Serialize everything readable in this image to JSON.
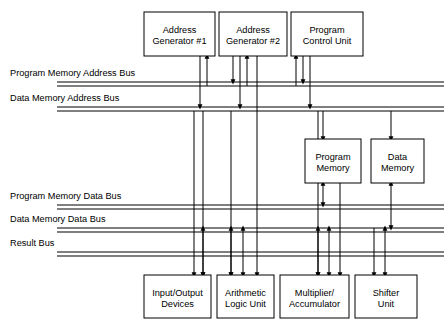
{
  "diagram": {
    "colors": {
      "line": "#000000",
      "background": "#ffffff",
      "box_fill": "#ffffff"
    },
    "units": [
      {
        "id": "address-generator-1",
        "line1": "Address",
        "line2": "Generator #1",
        "x": 144,
        "y": 12,
        "w": 71,
        "h": 44
      },
      {
        "id": "address-generator-2",
        "line1": "Address",
        "line2": "Generator #2",
        "x": 219,
        "y": 12,
        "w": 68,
        "h": 44
      },
      {
        "id": "program-control-unit",
        "line1": "Program",
        "line2": "Control Unit",
        "x": 291,
        "y": 12,
        "w": 72,
        "h": 44
      },
      {
        "id": "program-memory",
        "line1": "Program",
        "line2": "Memory",
        "x": 305,
        "y": 139,
        "w": 56,
        "h": 44
      },
      {
        "id": "data-memory",
        "line1": "Data",
        "line2": "Memory",
        "x": 371,
        "y": 139,
        "w": 53,
        "h": 44
      },
      {
        "id": "input-output-devices",
        "line1": "Input/Output",
        "line2": "Devices",
        "x": 144,
        "y": 275,
        "w": 67,
        "h": 43
      },
      {
        "id": "arithmetic-logic-unit",
        "line1": "Arithmetic",
        "line2": "Logic Unit",
        "x": 217,
        "y": 275,
        "w": 57,
        "h": 43
      },
      {
        "id": "multiplier-accumulator",
        "line1": "Multiplier/",
        "line2": "Accumulator",
        "x": 280,
        "y": 275,
        "w": 69,
        "h": 43
      },
      {
        "id": "shifter-unit",
        "line1": "Shifter",
        "line2": "Unit",
        "x": 355,
        "y": 275,
        "w": 62,
        "h": 43
      }
    ],
    "buses": [
      {
        "id": "program-memory-address-bus",
        "label": "Program Memory Address Bus",
        "label_x": 10,
        "label_y": 76,
        "y_top": 82,
        "y_bottom": 86,
        "x_start": 57,
        "x_end": 444
      },
      {
        "id": "data-memory-address-bus",
        "label": "Data Memory Address Bus",
        "label_x": 10,
        "label_y": 101,
        "y_top": 107,
        "y_bottom": 111,
        "x_start": 57,
        "x_end": 444
      },
      {
        "id": "program-memory-data-bus",
        "label": "Program Memory Data Bus",
        "label_x": 10,
        "label_y": 199,
        "y_top": 205,
        "y_bottom": 209,
        "x_start": 57,
        "x_end": 444
      },
      {
        "id": "data-memory-data-bus",
        "label": "Data Memory Data Bus",
        "label_x": 10,
        "label_y": 222,
        "y_top": 228,
        "y_bottom": 232,
        "x_start": 57,
        "x_end": 444
      },
      {
        "id": "result-bus",
        "label": "Result Bus",
        "label_x": 10,
        "label_y": 246,
        "y_top": 252,
        "y_bottom": 256,
        "x_start": 57,
        "x_end": 444
      }
    ],
    "connections": [
      {
        "id": "ag1-to-data-addr-bus",
        "x": 200,
        "y1": 56,
        "y2": 107,
        "arrow": "end"
      },
      {
        "id": "prog-addr-bus-to-ag1",
        "x": 207,
        "y1": 86,
        "y2": 56,
        "arrow": "end"
      },
      {
        "id": "ag2-to-prog-addr-bus",
        "x": 233,
        "y1": 56,
        "y2": 82,
        "arrow": "end"
      },
      {
        "id": "ag2-to-data-addr-bus",
        "x": 240,
        "y1": 56,
        "y2": 107,
        "arrow": "end"
      },
      {
        "id": "prog-addr-bus-to-ag2",
        "x": 247,
        "y1": 86,
        "y2": 56,
        "arrow": "end"
      },
      {
        "id": "prog-addr-bus-to-pcu",
        "x": 296,
        "y1": 86,
        "y2": 56,
        "arrow": "end"
      },
      {
        "id": "pcu-to-prog-addr-bus",
        "x": 303,
        "y1": 56,
        "y2": 82,
        "arrow": "end"
      },
      {
        "id": "pcu-to-data-addr-bus",
        "x": 310,
        "y1": 56,
        "y2": 107,
        "arrow": "end"
      },
      {
        "id": "data-addr-bus-to-prog-mem",
        "x": 323,
        "y1": 111,
        "y2": 139,
        "arrow": "end"
      },
      {
        "id": "data-addr-bus-to-data-mem",
        "x": 391,
        "y1": 111,
        "y2": 139,
        "arrow": "end"
      },
      {
        "id": "prog-mem-to-prog-data-bus",
        "x": 323,
        "y1": 183,
        "y2": 205,
        "arrow": "both"
      },
      {
        "id": "data-mem-to-data-data-bus",
        "x": 391,
        "y1": 183,
        "y2": 228,
        "arrow": "both"
      },
      {
        "id": "io-down-from-data-addr",
        "x": 194,
        "y1": 111,
        "y2": 275,
        "arrow": "end"
      },
      {
        "id": "io-down-from-prog-addr",
        "x": 203,
        "y1": 111,
        "y2": 275,
        "arrow": "end"
      },
      {
        "id": "alu-down-from-data-addr",
        "x": 231,
        "y1": 111,
        "y2": 275,
        "arrow": "end"
      },
      {
        "id": "alu-mid-vertical",
        "x": 243,
        "y1": 228,
        "y2": 275,
        "arrow": "both"
      },
      {
        "id": "alu-down-long",
        "x": 257,
        "y1": 56,
        "y2": 275,
        "arrow": "end"
      },
      {
        "id": "mac-down-from-data-addr",
        "x": 318,
        "y1": 111,
        "y2": 275,
        "arrow": "end"
      },
      {
        "id": "mac-mid-vertical",
        "x": 329,
        "y1": 228,
        "y2": 275,
        "arrow": "both"
      },
      {
        "id": "mac-down-long",
        "x": 340,
        "y1": 139,
        "y2": 275,
        "arrow": "end"
      },
      {
        "id": "shifter-down-from-data",
        "x": 374,
        "y1": 228,
        "y2": 275,
        "arrow": "end"
      },
      {
        "id": "shifter-up-to-result",
        "x": 385,
        "y1": 275,
        "y2": 228,
        "arrow": "both"
      },
      {
        "id": "io-up-to-data-data-bus",
        "x": 203,
        "y1": 275,
        "y2": 228,
        "arrow": "both"
      },
      {
        "id": "alu-up-to-data-data-bus",
        "x": 231,
        "y1": 275,
        "y2": 228,
        "arrow": "both"
      },
      {
        "id": "mac-up-to-data-data-bus",
        "x": 318,
        "y1": 275,
        "y2": 228,
        "arrow": "both"
      }
    ]
  }
}
